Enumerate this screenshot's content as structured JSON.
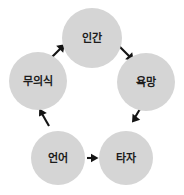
{
  "diagram": {
    "type": "cycle-diagram",
    "orientation": "clockwise",
    "background_color": "#ffffff",
    "node_fill_color": "#d5d5d5",
    "node_text_color": "#1c1c1c",
    "arrow_color": "#141414",
    "nodes": [
      {
        "id": "human",
        "label": "인간",
        "position": "top"
      },
      {
        "id": "desire",
        "label": "욕망",
        "position": "upper-right"
      },
      {
        "id": "other",
        "label": "타자",
        "position": "lower-right"
      },
      {
        "id": "language",
        "label": "언어",
        "position": "lower-left"
      },
      {
        "id": "unconscious",
        "label": "무의식",
        "position": "upper-left"
      }
    ],
    "edges": [
      {
        "id": "human-to-desire",
        "from": "human",
        "to": "desire",
        "direction": "down-right"
      },
      {
        "id": "desire-to-other",
        "from": "desire",
        "to": "other",
        "direction": "down-left"
      },
      {
        "id": "language-to-other",
        "from": "language",
        "to": "other",
        "direction": "right"
      },
      {
        "id": "language-to-unconsc",
        "from": "language",
        "to": "unconscious",
        "direction": "up-left"
      },
      {
        "id": "unconsc-to-human",
        "from": "unconscious",
        "to": "human",
        "direction": "up-right"
      }
    ]
  }
}
